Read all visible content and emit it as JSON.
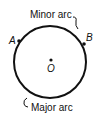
{
  "diagram": {
    "labels": {
      "minor_arc": "Minor arc",
      "major_arc": "Major arc",
      "point_a": "A",
      "point_b": "B",
      "center": "O"
    },
    "colors": {
      "stroke": "#111111",
      "background": "#ffffff"
    }
  }
}
